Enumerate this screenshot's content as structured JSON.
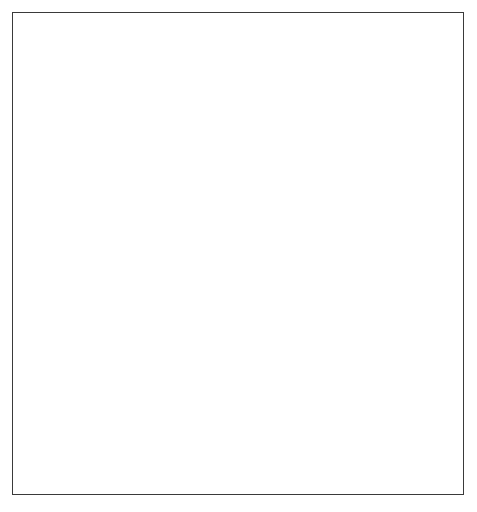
{
  "diagram": {
    "type": "cycle-diagram",
    "background_color": "#ffffff",
    "border_color": "#3a3a3a"
  },
  "ring": {
    "segments": [
      {
        "id": "acquire-knowledge",
        "label": "ACQUIRE KNOWLEDGE",
        "color": "#e8e8e8",
        "text_color": "#1c1c1c",
        "position": "top"
      },
      {
        "id": "perform-assessment",
        "label": "PERFORM ASSESSMENT",
        "color": "#8d8d8d",
        "text_color": "#3b3b3b",
        "position": "right"
      },
      {
        "id": "manage-improvement",
        "label": "MANAGE IMPROVEMENT",
        "color": "#2e2e2e",
        "text_color": "#e9e9e9",
        "position": "left-bottom"
      }
    ],
    "inner_band_color": "#a8a8a8",
    "inner_band_color_light": "#bdbdbd",
    "hub_color": "#ffffff"
  },
  "nodes": [
    {
      "id": "prepare-for-assessment",
      "lines": [
        "Prepare",
        "for",
        "Assessment"
      ],
      "color": "#6e6e6e",
      "outline": "#141414",
      "text_color": "#ffffff",
      "type": "entry"
    },
    {
      "id": "perform-assessment",
      "lines": [
        "Perform",
        "Assessment"
      ],
      "color": "#6e6e6e",
      "outline": "#141414",
      "text_color": "#ffffff",
      "type": "cycle"
    },
    {
      "id": "plan-for-improvements",
      "lines": [
        "Plan for",
        "Improvements"
      ],
      "color": "#6e6e6e",
      "outline": "#141414",
      "text_color": "#ffffff",
      "type": "cycle"
    },
    {
      "id": "implement-improvements",
      "lines": [
        "Implement",
        "Improvements"
      ],
      "color": "#6e6e6e",
      "outline": "#141414",
      "text_color": "#ffffff",
      "type": "cycle"
    },
    {
      "id": "repeat-the-process",
      "lines": [
        "Repeat",
        "the",
        "Process"
      ],
      "color": "#6e6e6e",
      "outline": "#141414",
      "text_color": "#ffffff",
      "type": "cycle"
    },
    {
      "id": "satisfied-with-results",
      "lines": [
        "Satisfied",
        "with",
        "Results"
      ],
      "color": "#8e8e8e",
      "outline": "#8e8e8e",
      "text_color": "#ffffff",
      "type": "outcome"
    }
  ],
  "node_text": {
    "prepare_1": "Prepare",
    "prepare_2": "for",
    "prepare_3": "Assessment",
    "perform_1": "Perform",
    "perform_2": "Assessment",
    "plan_1": "Plan for",
    "plan_2": "Improvements",
    "implement_1": "Implement",
    "implement_2": "Improvements",
    "repeat_1": "Repeat",
    "repeat_2": "the",
    "repeat_3": "Process",
    "satisfied_1": "Satisfied",
    "satisfied_2": "with",
    "satisfied_3": "Results"
  },
  "arc_text": {
    "acquire": "ACQUIRE KNOWLEDGE",
    "perform": "PERFORM ASSESSMENT",
    "manage": "MANAGE IMPROVEMENT"
  },
  "connectors": [
    {
      "id": "stem-prepare-to-ring",
      "style": "solid-bar",
      "color": "#c9c9c9"
    },
    {
      "id": "dotted-perform-to-satisfied",
      "style": "dotted-curve",
      "color": "#6e6e6e"
    },
    {
      "id": "flow-arrow-repeat-to-perform",
      "style": "curved-arrow",
      "color": "#8d8d8d"
    },
    {
      "id": "flow-arrow-perform-to-plan",
      "style": "curved-arrow",
      "color": "#8d8d8d"
    },
    {
      "id": "flow-arrow-plan-to-implement",
      "style": "curved-arrow",
      "color": "#8d8d8d"
    },
    {
      "id": "flow-arrow-implement-to-repeat",
      "style": "curved-arrow",
      "color": "#8d8d8d"
    }
  ]
}
